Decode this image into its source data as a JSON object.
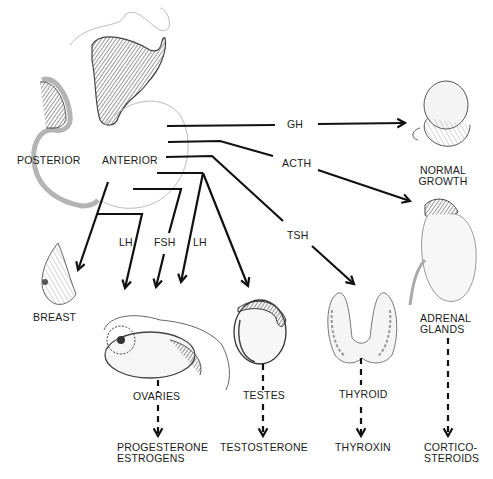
{
  "diagram": {
    "pituitary": {
      "posterior_label": "POSTERIOR",
      "anterior_label": "ANTERIOR"
    },
    "hormones": {
      "gh": "GH",
      "acth": "ACTH",
      "tsh": "TSH",
      "lh_left": "LH",
      "fsh": "FSH",
      "lh_right": "LH"
    },
    "targets": {
      "normal_growth": "NORMAL\nGROWTH",
      "adrenal_glands": "ADRENAL\nGLANDS",
      "breast": "BREAST",
      "ovaries": "OVARIES",
      "testes": "TESTES",
      "thyroid": "THYROID"
    },
    "secretions": {
      "ovaries": "PROGESTERONE\nESTROGENS",
      "testes": "TESTOSTERONE",
      "thyroid": "THYROXIN",
      "adrenal": "CORTICO-\nSTEROIDS"
    },
    "icons": {
      "pituitary": "pituitary-gland-illustration",
      "fetus": "fetus-illustration",
      "adrenal": "adrenal-kidney-illustration",
      "breast": "breast-illustration",
      "ovaries": "ovary-illustration",
      "testes": "testis-illustration",
      "thyroid": "thyroid-illustration"
    }
  }
}
